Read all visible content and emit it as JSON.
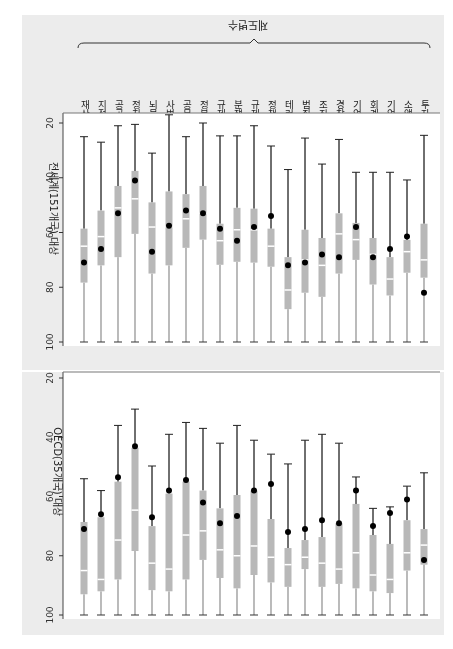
{
  "figure": {
    "group_title": "제도변수",
    "rotation_deg": 180
  },
  "chart_data": [
    {
      "type": "box",
      "title": "전세계(151개국) 대상",
      "ylabel": "전세계(151개국) 대상",
      "ylim": [
        20,
        100
      ],
      "yticks": [
        20,
        40,
        60,
        80,
        100
      ],
      "categories": [
        "재산권",
        "지적재산권",
        "공공기금",
        "정치인신뢰",
        "뇌물",
        "사법부독립",
        "공무원신뢰",
        "정부지출낭비",
        "규제부담",
        "분쟁해결",
        "규제대응",
        "정책투명성",
        "테러위협",
        "범죄대처",
        "조직범죄",
        "경찰서비스",
        "기업윤리",
        "회계기준",
        "기업이사회",
        "소액주주보호",
        "투자자보호"
      ],
      "whisker_low": [
        25,
        27,
        21,
        20.5,
        31,
        17,
        25,
        20,
        24.7,
        24.7,
        21,
        28.4,
        37,
        25.5,
        35,
        26,
        38,
        38,
        38,
        40.8,
        24.5
      ],
      "q1": [
        58.6,
        52,
        43,
        37.5,
        49,
        45,
        46,
        43,
        56.8,
        51,
        51.3,
        58.6,
        69,
        59,
        62,
        53,
        56.5,
        62,
        69,
        62.7,
        56.8
      ],
      "median": [
        65,
        61.5,
        51,
        47.7,
        58,
        58,
        55,
        53,
        63,
        59,
        59,
        65,
        81,
        70,
        72,
        60.5,
        62.6,
        68,
        77,
        67,
        70
      ],
      "q3": [
        78.3,
        72,
        69,
        60.5,
        75,
        72,
        65.6,
        62.6,
        71.8,
        70.7,
        71,
        72.5,
        88,
        82,
        83.5,
        75,
        70,
        79,
        83,
        74.7,
        76.5
      ],
      "whisker_high": [
        100,
        100,
        100,
        100,
        100,
        100,
        100,
        100,
        100,
        100,
        100,
        100,
        100,
        100,
        100,
        100,
        100,
        100,
        100,
        100,
        100
      ],
      "korea_point": [
        71,
        66,
        53,
        41,
        67,
        57.5,
        52,
        53,
        58.6,
        63,
        58,
        54,
        72,
        71,
        68,
        69,
        58,
        69,
        66,
        61.5,
        82
      ]
    },
    {
      "type": "box",
      "title": "OECD(35개국) 대상",
      "ylabel": "OECD(35개국) 대상",
      "ylim": [
        20,
        100
      ],
      "yticks": [
        20,
        40,
        60,
        80,
        100
      ],
      "categories": [
        "재산권",
        "지적재산권",
        "공공기금",
        "정치인신뢰",
        "뇌물",
        "사법부독립",
        "공무원신뢰",
        "정부지출낭비",
        "규제부담",
        "분쟁해결",
        "규제대응",
        "정책투명성",
        "테러위협",
        "범죄대처",
        "조직범죄",
        "경찰서비스",
        "기업윤리",
        "회계기준",
        "기업이사회",
        "소액주주보호",
        "투자자보호"
      ],
      "whisker_low": [
        54,
        58,
        36,
        30.5,
        49.7,
        39,
        35,
        37,
        42,
        36,
        41,
        45.7,
        49,
        41,
        39,
        42,
        53.4,
        64,
        63.5,
        56.5,
        52
      ],
      "q1": [
        68.6,
        67,
        55,
        43.6,
        70,
        59,
        55,
        58,
        64,
        59.5,
        58,
        67.6,
        77.4,
        74.7,
        73.7,
        69,
        62.5,
        73,
        76,
        68,
        71
      ],
      "median": [
        85,
        88,
        74.7,
        64.6,
        82.5,
        84.5,
        73,
        71.6,
        78,
        80,
        76.7,
        80.5,
        83,
        80.5,
        82.5,
        84.5,
        79,
        86.5,
        88,
        79,
        76.4
      ],
      "q3": [
        93,
        92,
        88,
        78.4,
        91.6,
        92,
        88,
        81.4,
        87.5,
        91,
        86.5,
        89,
        90.5,
        84.5,
        90.5,
        89.5,
        91,
        92,
        92.6,
        85,
        83
      ],
      "whisker_high": [
        100,
        100,
        100,
        100,
        100,
        100,
        100,
        100,
        100,
        100,
        100,
        100,
        100,
        100,
        100,
        100,
        100,
        100,
        100,
        100,
        100
      ],
      "korea_point": [
        71,
        66,
        53.5,
        43,
        67,
        58,
        54.4,
        62,
        69,
        66.6,
        58,
        55.8,
        72,
        71,
        68,
        69,
        58,
        70,
        65.6,
        61,
        81.4
      ]
    }
  ],
  "colors": {
    "box": "#b8b8b8",
    "median": "#ffffff",
    "whisker": "#222222",
    "point": "#000000",
    "panel_bg": "#ececec"
  }
}
